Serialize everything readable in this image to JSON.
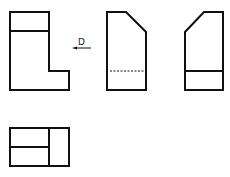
{
  "diagram": {
    "type": "orthographic-projection",
    "color": "#111111",
    "background": "#ffffff",
    "views": [
      {
        "name": "front-view",
        "shape": "L-shape with top band"
      },
      {
        "name": "side-view-hidden",
        "shape": "rectangle with top-right chamfer and hidden (dashed) line"
      },
      {
        "name": "side-view",
        "shape": "rectangle with top-left chamfer and solid line"
      },
      {
        "name": "top-view",
        "shape": "rectangle subdivided into three regions"
      }
    ],
    "direction_arrow": {
      "label": "D",
      "points": "left"
    }
  }
}
